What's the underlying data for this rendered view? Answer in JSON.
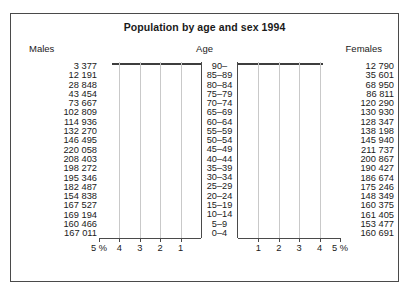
{
  "chart_data": {
    "type": "bar",
    "title": "Population by age and sex 1994",
    "subtype": "population-pyramid",
    "xlabel": "",
    "ylabel": "Age",
    "grid": true,
    "legend_position": "none",
    "headers": {
      "left": "Males",
      "center": "Age",
      "right": "Females"
    },
    "axis": {
      "unit": "%",
      "unit_label": "5 %",
      "left_ticks": [
        "5 %",
        "4",
        "3",
        "2",
        "1"
      ],
      "right_ticks": [
        "1",
        "2",
        "3",
        "4",
        "5 %"
      ],
      "max_percent": 5,
      "tick_step": 1,
      "range_left": [
        5,
        0
      ],
      "range_right": [
        0,
        5
      ]
    },
    "categories": [
      "90–",
      "85–89",
      "80–84",
      "75–79",
      "70–74",
      "65–69",
      "60–64",
      "55–59",
      "50–54",
      "45–49",
      "40–44",
      "35–39",
      "30–34",
      "25–29",
      "20–24",
      "15–19",
      "10–14",
      "5–9",
      "0–4"
    ],
    "series": [
      {
        "name": "Males",
        "side": "left",
        "values": [
          3377,
          12191,
          28848,
          43454,
          73667,
          102809,
          114936,
          132270,
          146495,
          220058,
          208403,
          198272,
          195346,
          182487,
          154838,
          167527,
          169194,
          160466,
          167011
        ],
        "labels": [
          "3 377",
          "12 191",
          "28 848",
          "43 454",
          "73 667",
          "102 809",
          "114 936",
          "132 270",
          "146 495",
          "220 058",
          "208 403",
          "198 272",
          "195 346",
          "182 487",
          "154 838",
          "167 527",
          "169 194",
          "160 466",
          "167 011"
        ],
        "percents": [
          0.07,
          0.24,
          0.57,
          0.86,
          1.45,
          2.03,
          2.27,
          2.61,
          2.89,
          4.34,
          4.11,
          3.91,
          3.86,
          3.6,
          3.06,
          3.31,
          3.34,
          3.17,
          3.3
        ]
      },
      {
        "name": "Females",
        "side": "right",
        "values": [
          12790,
          35601,
          68950,
          86811,
          120290,
          130930,
          128347,
          138198,
          145940,
          211737,
          200867,
          190427,
          186674,
          175246,
          148349,
          160375,
          161405,
          153477,
          160691
        ],
        "labels": [
          "12 790",
          "35 601",
          "68 950",
          "86 811",
          "120 290",
          "130 930",
          "128 347",
          "138 198",
          "145 940",
          "211 737",
          "200 867",
          "190 427",
          "186 674",
          "175 246",
          "148 349",
          "160 375",
          "161 405",
          "153 477",
          "160 691"
        ],
        "percents": [
          0.25,
          0.7,
          1.36,
          1.71,
          2.37,
          2.58,
          2.53,
          2.73,
          2.88,
          4.18,
          3.96,
          3.76,
          3.68,
          3.46,
          2.93,
          3.16,
          3.19,
          3.03,
          3.17
        ]
      }
    ],
    "colors": {
      "bar_fill": "#e3e3e3",
      "bar_stroke": "#3d3d3d",
      "grid": "#c9c9c9",
      "frame": "#4a4a4a",
      "text": "#1a1a1a",
      "background": "#ffffff"
    }
  }
}
